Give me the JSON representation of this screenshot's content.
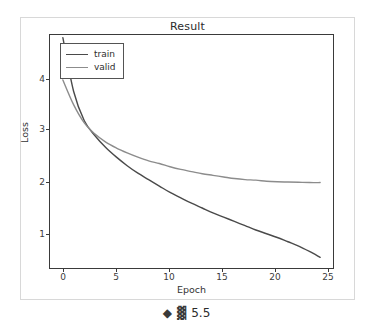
{
  "chart_data": {
    "type": "line",
    "title": "Result",
    "xlabel": "Epoch",
    "ylabel": "Loss",
    "xlim": [
      -1.2,
      25.2
    ],
    "ylim": [
      0.25,
      4.6
    ],
    "xticks": [
      0,
      5,
      10,
      15,
      20,
      25
    ],
    "yticks": [
      1,
      2,
      3,
      4
    ],
    "grid": false,
    "legend_position": "upper left",
    "x": [
      0,
      1,
      2,
      3,
      4,
      5,
      6,
      7,
      8,
      9,
      10,
      11,
      12,
      13,
      14,
      15,
      16,
      17,
      18,
      19,
      20,
      21,
      22,
      23,
      24
    ],
    "series": [
      {
        "name": "train",
        "color": "#4a4a4a",
        "values": [
          4.55,
          3.55,
          3.0,
          2.72,
          2.5,
          2.32,
          2.16,
          2.02,
          1.9,
          1.78,
          1.66,
          1.56,
          1.46,
          1.37,
          1.28,
          1.2,
          1.12,
          1.04,
          0.96,
          0.89,
          0.82,
          0.74,
          0.66,
          0.56,
          0.45
        ]
      },
      {
        "name": "valid",
        "color": "#8c8c8c",
        "values": [
          3.76,
          3.3,
          2.96,
          2.75,
          2.6,
          2.49,
          2.4,
          2.32,
          2.25,
          2.2,
          2.14,
          2.09,
          2.05,
          2.01,
          1.98,
          1.95,
          1.92,
          1.9,
          1.89,
          1.87,
          1.86,
          1.855,
          1.85,
          1.845,
          1.845
        ]
      }
    ]
  },
  "legend": {
    "entries": [
      {
        "label": "train"
      },
      {
        "label": "valid"
      }
    ]
  },
  "ticks": {
    "y": [
      "4",
      "3",
      "2",
      "1"
    ],
    "x": [
      "0",
      "5",
      "10",
      "15",
      "20",
      "25"
    ]
  },
  "status_bar": {
    "diamond_icon": "◆",
    "grid_icon": "▓",
    "value": "5.5"
  },
  "colors": {
    "train_line": "#4a4a4a",
    "valid_line": "#8c8c8c",
    "axes_border": "#3a3a3a",
    "figure_border": "#d8d8d8",
    "text": "#2b2b2b",
    "background": "#ffffff"
  }
}
